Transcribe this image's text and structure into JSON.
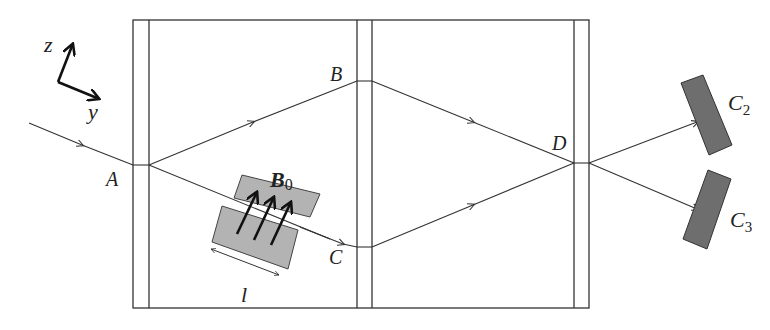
{
  "diagram": {
    "axes": {
      "z_label": "z",
      "y_label": "y"
    },
    "points": {
      "A": "A",
      "B": "B",
      "C": "C",
      "D": "D"
    },
    "field": {
      "label": "B",
      "subscript": "0"
    },
    "length_label": "l",
    "detectors": [
      {
        "label": "C",
        "subscript": "2"
      },
      {
        "label": "C",
        "subscript": "3"
      }
    ],
    "colors": {
      "line": "#333333",
      "magnet_fill": "#b3b3b3",
      "detector_fill": "#6e6e6e",
      "arrow": "#111111"
    }
  }
}
